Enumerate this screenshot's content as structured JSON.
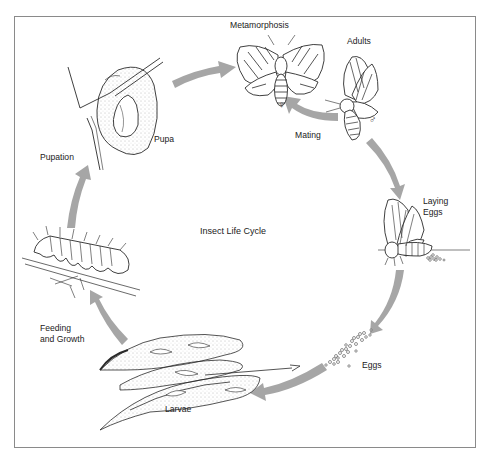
{
  "diagram": {
    "title": "Insect Life Cycle",
    "arrow_color": "#a6a6a6",
    "line_color": "#2a2a2a",
    "frame_color": "#8a8a8a",
    "stages": [
      {
        "id": "metamorphosis",
        "label": "Metamorphosis"
      },
      {
        "id": "adults",
        "label": "Adults"
      },
      {
        "id": "mating",
        "label": "Mating"
      },
      {
        "id": "laying-eggs",
        "label": "Laying\nEggs",
        "lines": [
          "Laying",
          "Eggs"
        ]
      },
      {
        "id": "eggs",
        "label": "Eggs"
      },
      {
        "id": "larvae",
        "label": "Larvae"
      },
      {
        "id": "feeding",
        "label": "Feeding\nand Growth",
        "lines": [
          "Feeding",
          "and Growth"
        ]
      },
      {
        "id": "pupation",
        "label": "Pupation"
      },
      {
        "id": "pupa",
        "label": "Pupa"
      }
    ],
    "symbols": {
      "female": "♀",
      "male": "♂"
    }
  }
}
